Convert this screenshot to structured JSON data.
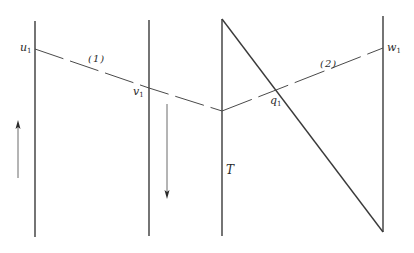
{
  "figure": {
    "type": "schematic diagram",
    "colors": {
      "line": "#3a3a3a",
      "thin_line": "#6a6a6a",
      "background": "#ffffff"
    }
  },
  "vertical_lines": [
    {
      "id": "line-1",
      "x": 35,
      "y1": 21,
      "y2": 237
    },
    {
      "id": "line-2",
      "x": 149,
      "y1": 20,
      "y2": 236
    },
    {
      "id": "line-3",
      "x": 222,
      "y1": 19,
      "y2": 236
    },
    {
      "id": "line-4",
      "x": 383,
      "y1": 16,
      "y2": 232
    }
  ],
  "diagonal_line": {
    "x1": 222,
    "y1": 19,
    "x2": 383,
    "y2": 232
  },
  "dashed_paths": [
    {
      "id": "path-1",
      "label": "(1)",
      "points": [
        [
          35,
          49
        ],
        [
          149,
          88
        ],
        [
          222,
          111
        ]
      ]
    },
    {
      "id": "path-2",
      "label": "(2)",
      "points": [
        [
          222,
          111
        ],
        [
          276,
          90
        ],
        [
          383,
          48
        ]
      ]
    }
  ],
  "arrows": [
    {
      "id": "arrow-up",
      "direction": "up",
      "x": 18,
      "y_from": 178,
      "y_to": 122
    },
    {
      "id": "arrow-down",
      "direction": "down",
      "x": 167,
      "y_from": 104,
      "y_to": 198
    }
  ],
  "labels": {
    "u1": {
      "base": "u",
      "sub": "1"
    },
    "v1": {
      "base": "v",
      "sub": "1"
    },
    "q1": {
      "base": "q",
      "sub": "1"
    },
    "w1": {
      "base": "w",
      "sub": "1"
    },
    "path1": "(1)",
    "path2": "(2)",
    "T": "T"
  }
}
